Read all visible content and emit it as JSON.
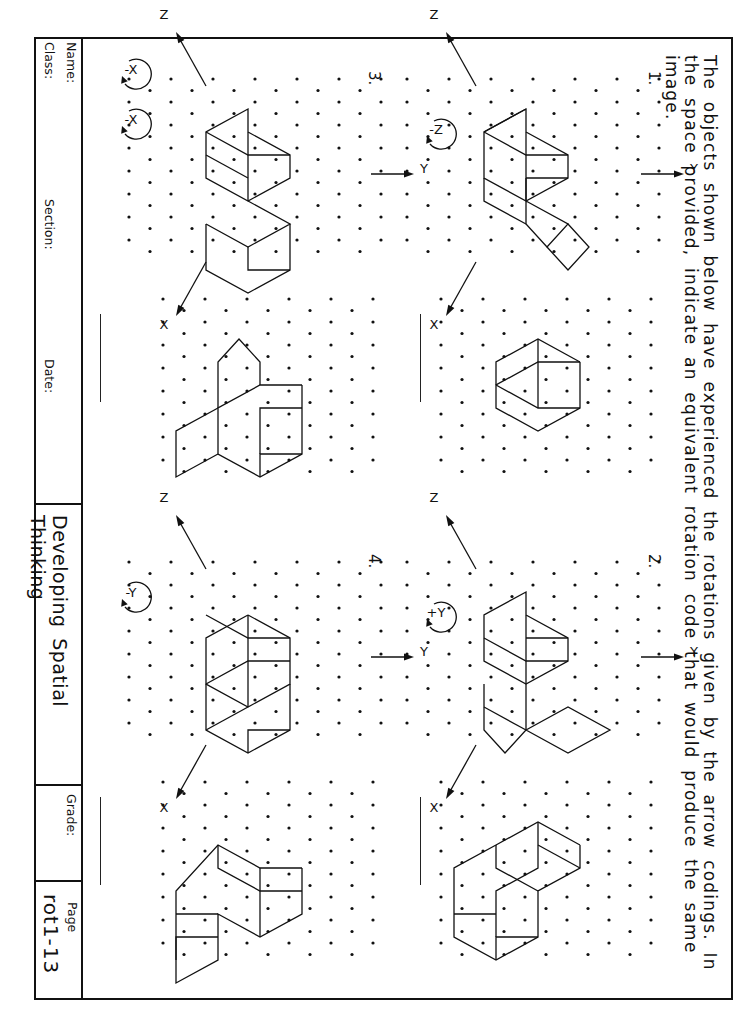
{
  "instructions": {
    "line1": "The objects shown below have experienced the rotations given by the arrow codings. In",
    "line2": "the space provided, indicate an equivalent rotation code that would produce the same image."
  },
  "problems": [
    {
      "number": "1.",
      "rotation_codes": [
        "-Z"
      ],
      "axes": {
        "x": "X",
        "y": "Y",
        "z": "Z"
      },
      "answer": ""
    },
    {
      "number": "2.",
      "rotation_codes": [
        "+Y"
      ],
      "axes": {
        "x": "X",
        "y": "Y",
        "z": "Z"
      },
      "answer": ""
    },
    {
      "number": "3.",
      "rotation_codes": [
        "-X",
        "-X"
      ],
      "axes": {
        "x": "X",
        "y": "Y",
        "z": "Z"
      },
      "answer": ""
    },
    {
      "number": "4.",
      "rotation_codes": [
        "-Y"
      ],
      "axes": {
        "x": "X",
        "y": "Y",
        "z": "Z"
      },
      "answer": ""
    }
  ],
  "title_block": {
    "name_label": "Name:",
    "class_label": "Class:",
    "section_label": "Section:",
    "date_label": "Date:",
    "course_title": "Developing Spatial Thinking",
    "grade_label": "Grade:",
    "page_label": "Page",
    "page_id": "rot1-13"
  },
  "icons": {
    "rotation_arrow": "circular-arrow-icon",
    "axis_arrow": "axis-arrow-icon",
    "isometric_grid": "dot-grid"
  }
}
